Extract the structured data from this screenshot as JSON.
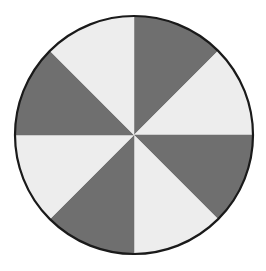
{
  "figure": {
    "background_color": "#ffffff",
    "width": 266,
    "height": 271,
    "outline_color": "#1a1a1a",
    "outline_width": 2.2,
    "center_x": 134,
    "center_y": 135,
    "radius": 119
  },
  "chart_data": {
    "type": "pie",
    "title": "",
    "subtitle": "",
    "xlabel": "",
    "ylabel": "",
    "grid": false,
    "legend": "none",
    "start_angle_deg": 90,
    "direction": "clockwise",
    "total": 8,
    "categories": [
      "Segment 1",
      "Segment 2",
      "Segment 3",
      "Segment 4",
      "Segment 5",
      "Segment 6",
      "Segment 7",
      "Segment 8"
    ],
    "values": [
      1,
      1,
      1,
      1,
      1,
      1,
      1,
      1
    ],
    "percentages": [
      12.5,
      12.5,
      12.5,
      12.5,
      12.5,
      12.5,
      12.5,
      12.5
    ],
    "angles_deg": [
      45,
      45,
      45,
      45,
      45,
      45,
      45,
      45
    ],
    "colors": [
      "#6f6f6f",
      "#ededed",
      "#6f6f6f",
      "#ededed",
      "#6f6f6f",
      "#ededed",
      "#6f6f6f",
      "#ededed"
    ],
    "palette": {
      "dark_gray": "#6f6f6f",
      "light_gray": "#ededed"
    },
    "slices": [
      {
        "label": "Segment 1",
        "value": 1,
        "start_deg": 0,
        "end_deg": 45,
        "color": "#6f6f6f"
      },
      {
        "label": "Segment 2",
        "value": 1,
        "start_deg": 45,
        "end_deg": 90,
        "color": "#ededed"
      },
      {
        "label": "Segment 3",
        "value": 1,
        "start_deg": 90,
        "end_deg": 135,
        "color": "#6f6f6f"
      },
      {
        "label": "Segment 4",
        "value": 1,
        "start_deg": 135,
        "end_deg": 180,
        "color": "#ededed"
      },
      {
        "label": "Segment 5",
        "value": 1,
        "start_deg": 180,
        "end_deg": 225,
        "color": "#6f6f6f"
      },
      {
        "label": "Segment 6",
        "value": 1,
        "start_deg": 225,
        "end_deg": 270,
        "color": "#ededed"
      },
      {
        "label": "Segment 7",
        "value": 1,
        "start_deg": 270,
        "end_deg": 315,
        "color": "#6f6f6f"
      },
      {
        "label": "Segment 8",
        "value": 1,
        "start_deg": 315,
        "end_deg": 360,
        "color": "#ededed"
      }
    ]
  }
}
